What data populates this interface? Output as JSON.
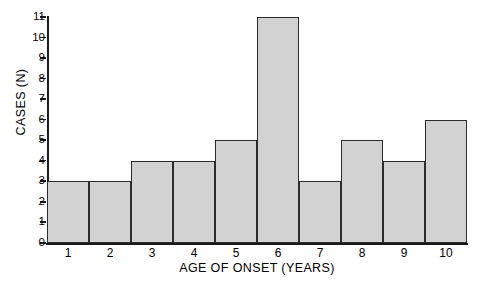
{
  "chart_data": {
    "type": "bar",
    "title": "",
    "xlabel": "AGE OF ONSET (YEARS)",
    "ylabel": "CASES (N)",
    "categories": [
      "1",
      "2",
      "3",
      "4",
      "5",
      "6",
      "7",
      "8",
      "9",
      "10"
    ],
    "values": [
      3,
      3,
      4,
      4,
      5,
      11,
      3,
      5,
      4,
      6
    ],
    "yticks": [
      0,
      1,
      2,
      3,
      4,
      5,
      6,
      7,
      8,
      9,
      10,
      11
    ],
    "ylim": [
      0,
      11
    ],
    "grid": false,
    "legend": null,
    "bar_fill_color": "#d2d2d2",
    "bar_border_color": "#2b2b2b",
    "axis_color": "#1a1a1a",
    "background_color": "#ffffff"
  }
}
